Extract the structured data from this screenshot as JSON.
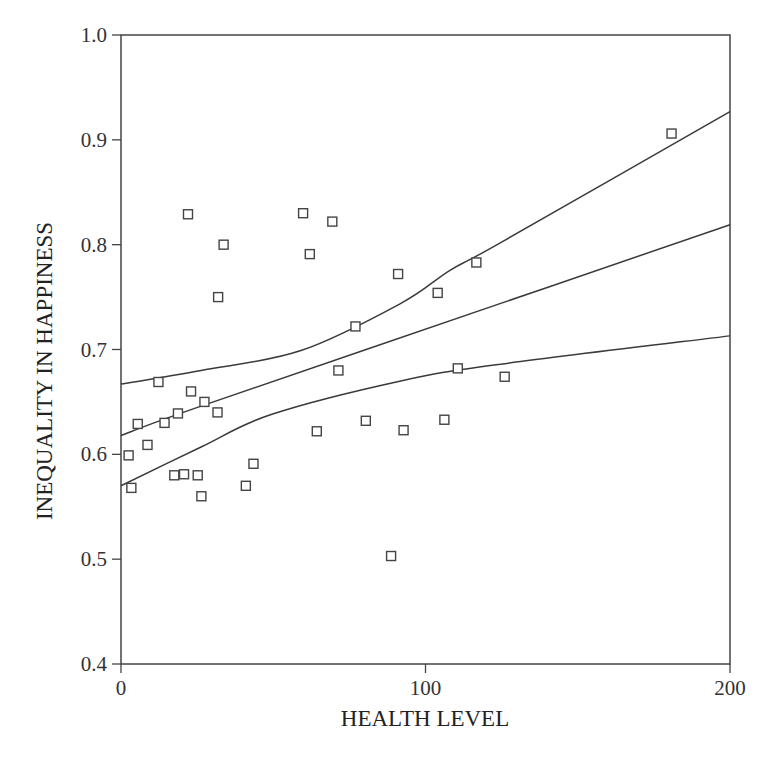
{
  "chart_data": {
    "type": "scatter",
    "title": "",
    "xlabel": "HEALTH LEVEL",
    "ylabel": "INEQUALITY IN HAPPINESS",
    "xlim": [
      0,
      200
    ],
    "ylim": [
      0.4,
      1.0
    ],
    "x_ticks": [
      0,
      100,
      200
    ],
    "x_tick_labels": [
      "0",
      "100",
      "200"
    ],
    "y_ticks": [
      0.4,
      0.5,
      0.6,
      0.7,
      0.8,
      0.9,
      1.0
    ],
    "y_tick_labels": [
      "0.4",
      "0.5",
      "0.6",
      "0.7",
      "0.8",
      "0.9",
      "1.0"
    ],
    "grid": false,
    "legend": null,
    "marker": "open-square",
    "points": [
      {
        "x": 2.5,
        "y": 0.599
      },
      {
        "x": 3.4,
        "y": 0.568
      },
      {
        "x": 5.5,
        "y": 0.629
      },
      {
        "x": 8.7,
        "y": 0.609
      },
      {
        "x": 12.3,
        "y": 0.669
      },
      {
        "x": 14.3,
        "y": 0.63
      },
      {
        "x": 17.5,
        "y": 0.58
      },
      {
        "x": 18.7,
        "y": 0.639
      },
      {
        "x": 20.7,
        "y": 0.581
      },
      {
        "x": 22.0,
        "y": 0.829
      },
      {
        "x": 23.0,
        "y": 0.66
      },
      {
        "x": 25.2,
        "y": 0.58
      },
      {
        "x": 26.4,
        "y": 0.56
      },
      {
        "x": 27.4,
        "y": 0.65
      },
      {
        "x": 31.7,
        "y": 0.64
      },
      {
        "x": 31.9,
        "y": 0.75
      },
      {
        "x": 33.7,
        "y": 0.8
      },
      {
        "x": 41.0,
        "y": 0.57
      },
      {
        "x": 43.5,
        "y": 0.591
      },
      {
        "x": 59.8,
        "y": 0.83
      },
      {
        "x": 62.0,
        "y": 0.791
      },
      {
        "x": 64.3,
        "y": 0.622
      },
      {
        "x": 69.4,
        "y": 0.822
      },
      {
        "x": 71.4,
        "y": 0.68
      },
      {
        "x": 77.0,
        "y": 0.722
      },
      {
        "x": 80.4,
        "y": 0.632
      },
      {
        "x": 88.7,
        "y": 0.503
      },
      {
        "x": 91.0,
        "y": 0.772
      },
      {
        "x": 92.8,
        "y": 0.623
      },
      {
        "x": 104.0,
        "y": 0.754
      },
      {
        "x": 106.2,
        "y": 0.633
      },
      {
        "x": 110.6,
        "y": 0.682
      },
      {
        "x": 116.7,
        "y": 0.783
      },
      {
        "x": 126.0,
        "y": 0.674
      },
      {
        "x": 180.8,
        "y": 0.906
      }
    ],
    "series": [
      {
        "name": "upper confidence band",
        "type": "line",
        "x": [
          0,
          26.3,
          59.1,
          91.9,
          108.3,
          124.7,
          200
        ],
        "y": [
          0.667,
          0.68,
          0.699,
          0.744,
          0.776,
          0.802,
          0.927
        ]
      },
      {
        "name": "fitted regression line",
        "type": "line",
        "x": [
          0,
          26.3,
          124.7,
          200
        ],
        "y": [
          0.618,
          0.646,
          0.744,
          0.819
        ]
      },
      {
        "name": "lower confidence band",
        "type": "line",
        "x": [
          0,
          26.3,
          49.3,
          91.9,
          124.7,
          200
        ],
        "y": [
          0.57,
          0.607,
          0.638,
          0.67,
          0.686,
          0.713
        ]
      }
    ]
  }
}
